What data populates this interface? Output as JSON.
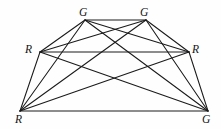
{
  "figure": {
    "type": "complete-graph-diagram",
    "width": 221,
    "height": 129,
    "background_color": "#fefefe",
    "edge_color": "#1a1a1a",
    "edge_width": 1.05,
    "label_color": "#141414",
    "label_style": "italic-serif",
    "vertex_count": 6,
    "edge_count": 15
  },
  "vertices": [
    {
      "id": "v0",
      "label": "G",
      "name": "vertex-top-left-g",
      "x": 85,
      "y": 20,
      "label_x": 79,
      "label_y": 7
    },
    {
      "id": "v1",
      "label": "G",
      "name": "vertex-top-right-g",
      "x": 146,
      "y": 20,
      "label_x": 140,
      "label_y": 7
    },
    {
      "id": "v2",
      "label": "R",
      "name": "vertex-mid-left-r",
      "x": 40,
      "y": 52,
      "label_x": 25,
      "label_y": 44
    },
    {
      "id": "v3",
      "label": "R",
      "name": "vertex-mid-right-r",
      "x": 189,
      "y": 52,
      "label_x": 192,
      "label_y": 44
    },
    {
      "id": "v4",
      "label": "R",
      "name": "vertex-bottom-left-r",
      "x": 20,
      "y": 111,
      "label_x": 15,
      "label_y": 114
    },
    {
      "id": "v5",
      "label": "G",
      "name": "vertex-bottom-right-g",
      "x": 208,
      "y": 111,
      "label_x": 202,
      "label_y": 114
    }
  ],
  "edges": [
    {
      "from": "v0",
      "to": "v1",
      "name": "edge-top-g-to-top-g"
    },
    {
      "from": "v0",
      "to": "v2",
      "name": "edge-top-left-g-to-mid-left-r"
    },
    {
      "from": "v0",
      "to": "v3",
      "name": "edge-top-left-g-to-mid-right-r"
    },
    {
      "from": "v0",
      "to": "v4",
      "name": "edge-top-left-g-to-bottom-left-r"
    },
    {
      "from": "v0",
      "to": "v5",
      "name": "edge-top-left-g-to-bottom-right-g"
    },
    {
      "from": "v1",
      "to": "v2",
      "name": "edge-top-right-g-to-mid-left-r"
    },
    {
      "from": "v1",
      "to": "v3",
      "name": "edge-top-right-g-to-mid-right-r"
    },
    {
      "from": "v1",
      "to": "v4",
      "name": "edge-top-right-g-to-bottom-left-r"
    },
    {
      "from": "v1",
      "to": "v5",
      "name": "edge-top-right-g-to-bottom-right-g"
    },
    {
      "from": "v2",
      "to": "v3",
      "name": "edge-mid-left-r-to-mid-right-r"
    },
    {
      "from": "v2",
      "to": "v4",
      "name": "edge-mid-left-r-to-bottom-left-r"
    },
    {
      "from": "v2",
      "to": "v5",
      "name": "edge-mid-left-r-to-bottom-right-g"
    },
    {
      "from": "v3",
      "to": "v4",
      "name": "edge-mid-right-r-to-bottom-left-r"
    },
    {
      "from": "v3",
      "to": "v5",
      "name": "edge-mid-right-r-to-bottom-right-g"
    },
    {
      "from": "v4",
      "to": "v5",
      "name": "edge-bottom-left-r-to-bottom-right-g"
    }
  ]
}
